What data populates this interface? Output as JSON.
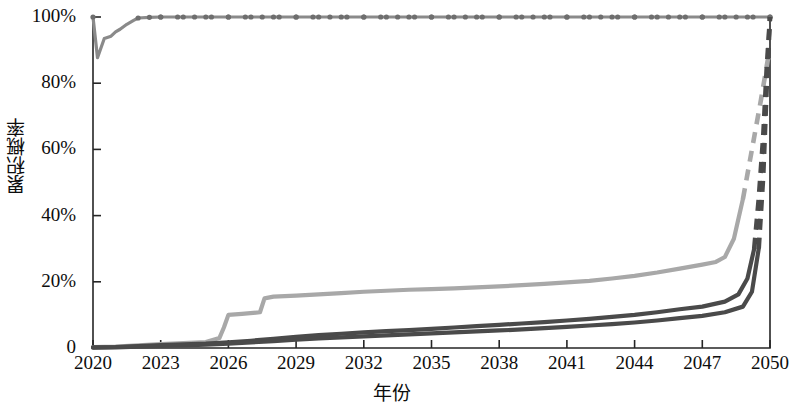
{
  "chart_data": {
    "type": "line",
    "title": "",
    "xlabel": "年份",
    "ylabel": "累积概率",
    "xlim": [
      2020,
      2050
    ],
    "ylim": [
      0,
      1
    ],
    "grid": false,
    "legend": "none",
    "xticks": [
      "2020",
      "2023",
      "2026",
      "2029",
      "2032",
      "2035",
      "2038",
      "2041",
      "2044",
      "2047",
      "2050"
    ],
    "xtick_values": [
      2020,
      2023,
      2026,
      2029,
      2032,
      2035,
      2038,
      2041,
      2044,
      2047,
      2050
    ],
    "yticks": [
      "0",
      "20%",
      "40%",
      "60%",
      "80%",
      "100%"
    ],
    "ytick_values": [
      0,
      0.2,
      0.4,
      0.6,
      0.8,
      1.0
    ],
    "series": [
      {
        "name": "series-1-top",
        "color": "#8a8a8a",
        "style": "solid-with-markers",
        "marker": "circle",
        "x": [
          2020.0,
          2020.2,
          2020.5,
          2020.8,
          2021.0,
          2021.2,
          2021.5,
          2021.8,
          2022.0,
          2022.5,
          2023.0,
          2024.0,
          2025.0,
          2026.0,
          2027.0,
          2028.0,
          2029.0,
          2030.0,
          2031.0,
          2032.0,
          2033.0,
          2034.0,
          2035.0,
          2036.0,
          2037.0,
          2038.0,
          2039.0,
          2040.0,
          2041.0,
          2042.0,
          2043.0,
          2044.0,
          2045.0,
          2046.0,
          2047.0,
          2048.0,
          2049.0,
          2050.0
        ],
        "values": [
          1.0,
          0.877,
          0.935,
          0.942,
          0.955,
          0.963,
          0.978,
          0.99,
          0.997,
          0.999,
          1.0,
          1.0,
          1.0,
          1.0,
          1.0,
          1.0,
          1.0,
          1.0,
          1.0,
          1.0,
          1.0,
          1.0,
          1.0,
          1.0,
          1.0,
          1.0,
          1.0,
          1.0,
          1.0,
          1.0,
          1.0,
          1.0,
          1.0,
          1.0,
          1.0,
          1.0,
          1.0,
          1.0
        ]
      },
      {
        "name": "series-2-light-gray",
        "color": "#a8a8a8",
        "style": "solid-then-dashed",
        "dash_start_year": 2048.6,
        "x": [
          2020,
          2021,
          2022,
          2023,
          2024,
          2025,
          2025.6,
          2025.8,
          2026.0,
          2026.6,
          2027.4,
          2027.6,
          2028.0,
          2029,
          2030,
          2031,
          2032,
          2033,
          2034,
          2035,
          2036,
          2037,
          2038,
          2039,
          2040,
          2041,
          2042,
          2043,
          2044,
          2045,
          2046,
          2047,
          2047.6,
          2048.0,
          2048.4,
          2048.8,
          2049.2,
          2049.6,
          2049.9,
          2050.0
        ],
        "values": [
          0.003,
          0.004,
          0.008,
          0.012,
          0.015,
          0.018,
          0.03,
          0.062,
          0.1,
          0.103,
          0.108,
          0.15,
          0.155,
          0.158,
          0.162,
          0.166,
          0.17,
          0.173,
          0.176,
          0.178,
          0.18,
          0.183,
          0.186,
          0.19,
          0.194,
          0.198,
          0.203,
          0.21,
          0.218,
          0.228,
          0.24,
          0.252,
          0.26,
          0.275,
          0.33,
          0.45,
          0.6,
          0.75,
          0.87,
          0.89
        ]
      },
      {
        "name": "series-3-dark-upper",
        "color": "#4a4a4a",
        "style": "solid-then-dashed",
        "dash_start_year": 2049.2,
        "x": [
          2020,
          2021,
          2022,
          2023,
          2024,
          2025,
          2026,
          2027,
          2028,
          2029,
          2030,
          2031,
          2032,
          2033,
          2034,
          2035,
          2036,
          2037,
          2038,
          2039,
          2040,
          2041,
          2042,
          2043,
          2044,
          2045,
          2046,
          2047,
          2048,
          2048.6,
          2049.0,
          2049.3,
          2049.5,
          2049.7,
          2049.85,
          2050.0
        ],
        "values": [
          0.002,
          0.003,
          0.006,
          0.009,
          0.011,
          0.013,
          0.017,
          0.022,
          0.028,
          0.034,
          0.039,
          0.043,
          0.047,
          0.051,
          0.054,
          0.058,
          0.062,
          0.066,
          0.07,
          0.074,
          0.078,
          0.083,
          0.088,
          0.094,
          0.1,
          0.108,
          0.117,
          0.125,
          0.14,
          0.162,
          0.21,
          0.3,
          0.45,
          0.64,
          0.84,
          1.0
        ]
      },
      {
        "name": "series-4-dark-lower",
        "color": "#4a4a4a",
        "style": "solid-then-dashed",
        "dash_start_year": 2049.4,
        "x": [
          2020,
          2021,
          2022,
          2023,
          2024,
          2025,
          2026,
          2027,
          2028,
          2029,
          2030,
          2031,
          2032,
          2033,
          2034,
          2035,
          2036,
          2037,
          2038,
          2039,
          2040,
          2041,
          2042,
          2043,
          2044,
          2045,
          2046,
          2047,
          2048,
          2048.8,
          2049.2,
          2049.5,
          2049.7,
          2049.85,
          2050.0
        ],
        "values": [
          0.001,
          0.002,
          0.004,
          0.006,
          0.008,
          0.01,
          0.013,
          0.017,
          0.021,
          0.025,
          0.029,
          0.032,
          0.035,
          0.038,
          0.041,
          0.044,
          0.047,
          0.05,
          0.053,
          0.056,
          0.06,
          0.064,
          0.068,
          0.072,
          0.077,
          0.083,
          0.09,
          0.097,
          0.108,
          0.125,
          0.17,
          0.3,
          0.52,
          0.78,
          1.0
        ]
      }
    ]
  },
  "axes": {
    "left_px": 93,
    "right_px": 770,
    "top_px": 17,
    "bottom_px": 348
  }
}
